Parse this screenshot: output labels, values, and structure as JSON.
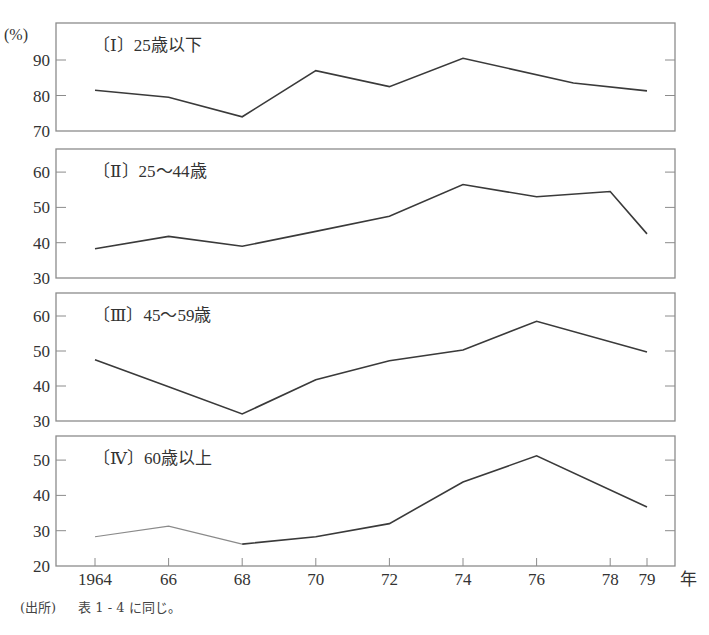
{
  "unit_label": "(%)",
  "x_unit": "年",
  "source": {
    "tag": "(出所)",
    "text": "表 1 - 4 に同じ。"
  },
  "colors": {
    "line": "#3a3a3a",
    "line_light": "#8a8a8a",
    "frame": "#8c8c8c",
    "text": "#333333"
  },
  "chart_data": [
    {
      "type": "line",
      "title": "〔Ⅰ〕25歳以下",
      "xlabel": "年",
      "ylabel": "(%)",
      "ylim": [
        70,
        95
      ],
      "yticks": [
        70,
        80,
        90
      ],
      "x": [
        1964,
        1966,
        1968,
        1970,
        1972,
        1974,
        1977,
        1979
      ],
      "values": [
        81.5,
        79.5,
        74.0,
        87.0,
        82.5,
        90.5,
        83.5,
        81.3
      ]
    },
    {
      "type": "line",
      "title": "〔Ⅱ〕25〜44歳",
      "xlabel": "年",
      "ylabel": "(%)",
      "ylim": [
        30,
        64
      ],
      "yticks": [
        30,
        40,
        50,
        60
      ],
      "x": [
        1964,
        1966,
        1968,
        1970,
        1972,
        1974,
        1976,
        1978,
        1979
      ],
      "values": [
        38.3,
        41.8,
        39.0,
        43.2,
        47.5,
        56.5,
        53.0,
        54.5,
        42.5
      ]
    },
    {
      "type": "line",
      "title": "〔Ⅲ〕45〜59歳",
      "xlabel": "年",
      "ylabel": "(%)",
      "ylim": [
        30,
        64
      ],
      "yticks": [
        30,
        40,
        50,
        60
      ],
      "x": [
        1964,
        1966,
        1968,
        1970,
        1972,
        1974,
        1976,
        1979
      ],
      "values": [
        47.5,
        39.8,
        32.0,
        41.8,
        47.2,
        50.3,
        58.5,
        49.7
      ]
    },
    {
      "type": "line",
      "title": "〔Ⅳ〕60歳以上",
      "xlabel": "年",
      "ylabel": "(%)",
      "ylim": [
        20,
        57
      ],
      "yticks": [
        20,
        30,
        40,
        50
      ],
      "x": [
        1964,
        1966,
        1968,
        1970,
        1972,
        1974,
        1976,
        1979
      ],
      "values": [
        28.3,
        31.3,
        26.2,
        28.3,
        32.0,
        43.8,
        51.2,
        36.7
      ],
      "light_segment_until": 1968
    }
  ],
  "x_axis": {
    "ticks": [
      1964,
      1966,
      1968,
      1970,
      1972,
      1974,
      1976,
      1978,
      1979
    ],
    "tick_labels": [
      "1964",
      "66",
      "68",
      "70",
      "72",
      "74",
      "76",
      "78",
      "79"
    ]
  }
}
